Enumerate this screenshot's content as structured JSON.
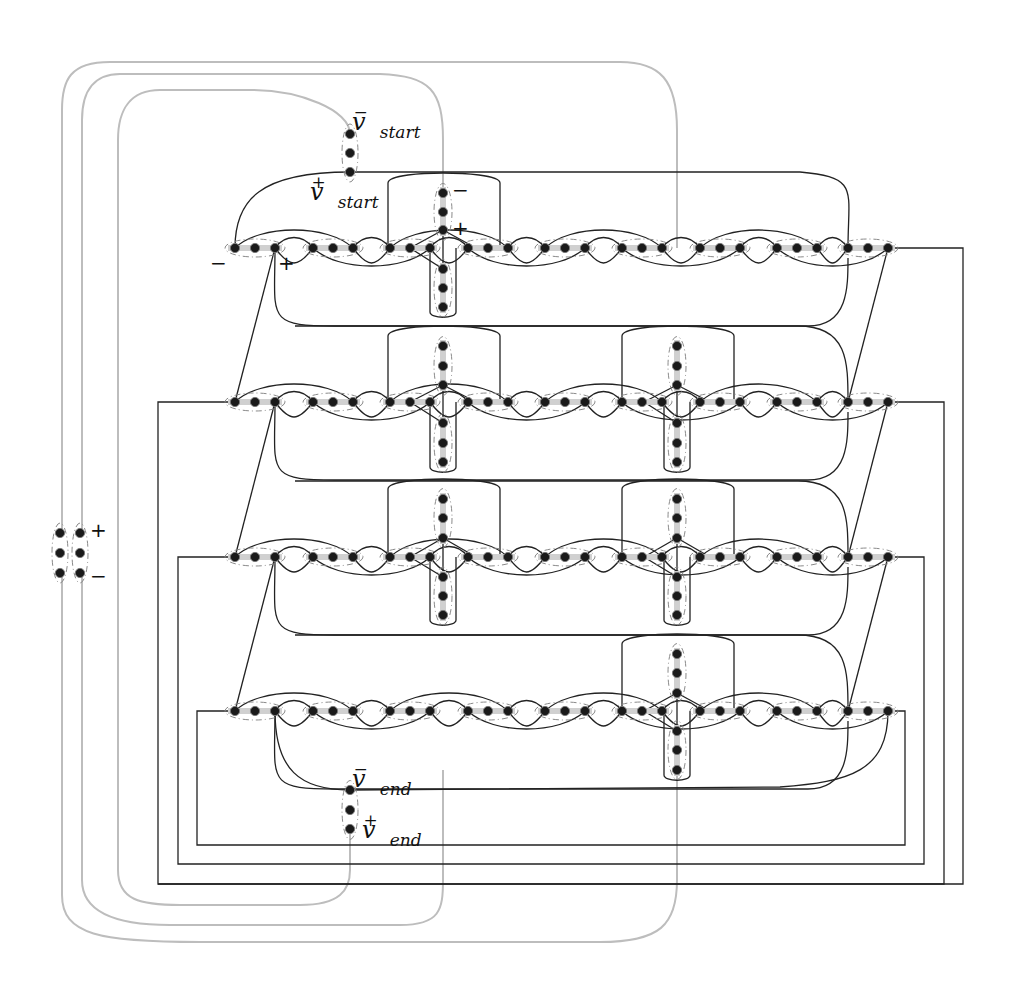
{
  "figure": {
    "caption": "",
    "colors": {
      "edge": "#222222",
      "vertex": "#1a1a1a",
      "gray_loop": "#bdbdbd",
      "gadget_outline": "#8a8a8a",
      "highlight": "#d0d0d0"
    },
    "labels": {
      "v_start_minus": {
        "base": "v",
        "sub": "start",
        "sup": "−"
      },
      "v_start_plus": {
        "base": "v",
        "sub": "start",
        "sup": "+"
      },
      "v_end_minus": {
        "base": "v",
        "sub": "end",
        "sup": "−"
      },
      "v_end_plus": {
        "base": "v",
        "sub": "end",
        "sup": "+"
      }
    },
    "signs": [
      {
        "text": "−",
        "x": 210,
        "y": 253
      },
      {
        "text": "+",
        "x": 278,
        "y": 253
      },
      {
        "text": "−",
        "x": 452,
        "y": 180
      },
      {
        "text": "+",
        "x": 452,
        "y": 218
      },
      {
        "text": "+",
        "x": 90,
        "y": 520
      },
      {
        "text": "−",
        "x": 90,
        "y": 566
      }
    ],
    "rows_y": [
      248,
      402,
      557,
      711
    ],
    "triplet_x": [
      235,
      313,
      390,
      468,
      545,
      622,
      700,
      777,
      848
    ],
    "triplet_spacing": 20,
    "cross_gadgets": [
      {
        "x": 443,
        "row": 0,
        "top": [
          193,
          212,
          230
        ],
        "bottom": [
          269,
          288,
          307
        ]
      },
      {
        "x": 443,
        "row": 1,
        "top": [
          346,
          366,
          385
        ],
        "bottom": [
          423,
          443,
          462
        ]
      },
      {
        "x": 443,
        "row": 2,
        "top": [
          499,
          518,
          538
        ],
        "bottom": [
          577,
          596,
          615
        ]
      },
      {
        "x": 677,
        "row": 1,
        "top": [
          346,
          366,
          385
        ],
        "bottom": [
          423,
          443,
          462
        ]
      },
      {
        "x": 677,
        "row": 2,
        "top": [
          499,
          518,
          538
        ],
        "bottom": [
          577,
          596,
          615
        ]
      },
      {
        "x": 677,
        "row": 3,
        "top": [
          654,
          673,
          693
        ],
        "bottom": [
          731,
          750,
          770
        ]
      }
    ],
    "start_gadget": {
      "x": 350,
      "ys": [
        134,
        153,
        172
      ]
    },
    "end_gadget": {
      "x": 350,
      "ys": [
        790,
        810,
        829
      ]
    },
    "side_gadgets": [
      {
        "x": 60,
        "ys": [
          533,
          553,
          573
        ]
      },
      {
        "x": 80,
        "ys": [
          533,
          553,
          573
        ]
      }
    ],
    "frames": [
      {
        "x1": 158,
        "y1": 402,
        "x2": 944,
        "y2": 884
      },
      {
        "x1": 178,
        "y1": 557,
        "x2": 924,
        "y2": 864
      },
      {
        "x1": 197,
        "y1": 711,
        "x2": 905,
        "y2": 845
      }
    ],
    "row1_exit": {
      "x2": 963,
      "y2": 884
    }
  }
}
